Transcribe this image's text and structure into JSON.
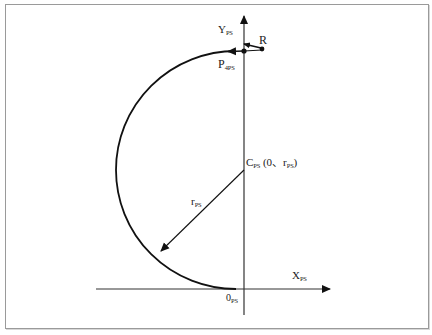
{
  "diagram": {
    "type": "geometry-coordinate-diagram",
    "colors": {
      "stroke": "#1a1a1a",
      "frame": "#9a9a9a",
      "background": "#ffffff"
    },
    "axes": {
      "x": {
        "label": "X",
        "subscript": "PS"
      },
      "y": {
        "label": "Y",
        "subscript": "PS"
      }
    },
    "origin": {
      "label": "0",
      "subscript": "PS"
    },
    "center": {
      "label": "C",
      "subscript": "PS",
      "coords_open": " (0、r",
      "coords_sub": "PS",
      "coords_close": ")"
    },
    "radius": {
      "label": "r",
      "subscript": "PS"
    },
    "point_p": {
      "label": "P",
      "subscript": "4PS"
    },
    "point_r": {
      "label": "R"
    }
  }
}
